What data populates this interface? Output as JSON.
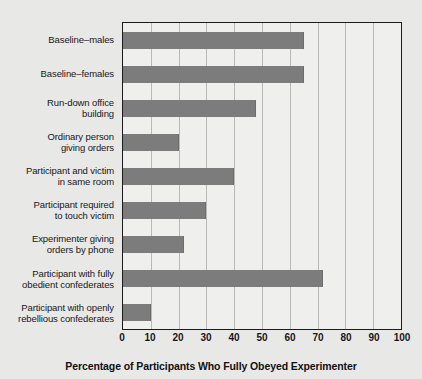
{
  "chart_data": {
    "type": "bar",
    "orientation": "horizontal",
    "title": "",
    "xlabel": "Percentage of Participants Who Fully Obeyed Experimenter",
    "ylabel": "",
    "xlim": [
      0,
      100
    ],
    "xticks": [
      0,
      10,
      20,
      30,
      40,
      50,
      60,
      70,
      80,
      90,
      100
    ],
    "grid": true,
    "legend": "none",
    "bar_color": "#7c7c7c",
    "plot_background": "#efefee",
    "figure_background": "#e8e8e6",
    "categories": [
      "Baseline–males",
      "Baseline–females",
      "Run-down office\nbuilding",
      "Ordinary person\ngiving orders",
      "Participant and victim\nin same room",
      "Participant required\nto touch victim",
      "Experimenter giving\norders by phone",
      "Participant with fully\nobedient confederates",
      "Participant with openly\nrebellious confederates"
    ],
    "values": [
      65,
      65,
      48,
      20,
      40,
      30,
      22,
      72,
      10
    ]
  }
}
